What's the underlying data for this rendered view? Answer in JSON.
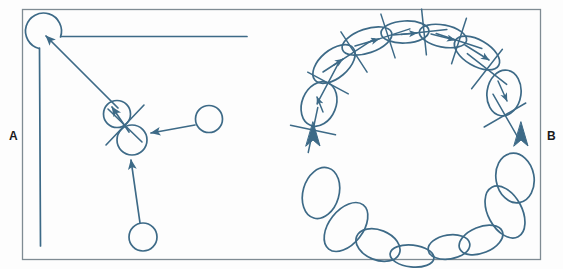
{
  "figure": {
    "background_color": "#fdfdfd",
    "ink_color": "#3d6a87",
    "border_color": "#7f8b93",
    "label_color": "#1a1a1a",
    "width": 563,
    "height": 269,
    "frame": {
      "x": 22,
      "y": 9,
      "width": 519,
      "height": 251
    }
  },
  "labels": {
    "panel_a": "A",
    "panel_b": "B"
  },
  "panel_a": {
    "name": "panel-a-circles-and-arrows",
    "corner_structure": {
      "name": "rounded-corner-track",
      "circle": {
        "cx": 45,
        "cy": 30,
        "r": 18
      },
      "horizontal_line": {
        "x1": 61,
        "y1": 36,
        "x2": 247,
        "y2": 36
      },
      "vertical_line": {
        "x1": 39,
        "y1": 48,
        "x2": 40,
        "y2": 246
      }
    },
    "circles": [
      {
        "name": "circle-corner",
        "cx": 45,
        "cy": 30,
        "r": 18
      },
      {
        "name": "circle-upper-mid",
        "cx": 117,
        "cy": 114,
        "r": 13
      },
      {
        "name": "circle-lower-mid",
        "cx": 132,
        "cy": 139,
        "r": 15
      },
      {
        "name": "circle-right",
        "cx": 209,
        "cy": 119,
        "r": 13
      },
      {
        "name": "circle-bottom",
        "cx": 143,
        "cy": 237,
        "r": 14
      }
    ],
    "cross_mark": {
      "name": "x-crossing-mark",
      "cx": 124,
      "cy": 126,
      "arm": 22
    },
    "arrows": [
      {
        "name": "arrow-to-corner",
        "x1": 118,
        "y1": 110,
        "x2": 42,
        "y2": 35
      },
      {
        "name": "arrow-inner-short",
        "x1": 128,
        "y1": 131,
        "x2": 110,
        "y2": 105
      },
      {
        "name": "arrow-from-right",
        "x1": 196,
        "y1": 125,
        "x2": 148,
        "y2": 133
      },
      {
        "name": "arrow-from-bottom",
        "x1": 140,
        "y1": 224,
        "x2": 131,
        "y2": 158
      }
    ]
  },
  "panel_b": {
    "name": "panel-b-ellipse-ring",
    "ring_center": {
      "cx": 406,
      "cy": 140
    },
    "upper_arc_ellipses": [
      {
        "name": "ellipse-u1",
        "cx": 319,
        "cy": 104,
        "rx": 17,
        "ry": 22,
        "rot": 22,
        "marked": true
      },
      {
        "name": "ellipse-u2",
        "cx": 333,
        "cy": 65,
        "rx": 24,
        "ry": 14,
        "rot": -38,
        "marked": true
      },
      {
        "name": "ellipse-u3",
        "cx": 366,
        "cy": 41,
        "rx": 25,
        "ry": 12,
        "rot": -18,
        "marked": true
      },
      {
        "name": "ellipse-u4",
        "cx": 404,
        "cy": 33,
        "rx": 23,
        "ry": 11,
        "rot": -3,
        "marked": true
      },
      {
        "name": "ellipse-u5",
        "cx": 443,
        "cy": 36,
        "rx": 23,
        "ry": 11,
        "rot": 10,
        "marked": true
      },
      {
        "name": "ellipse-u6",
        "cx": 478,
        "cy": 52,
        "rx": 24,
        "ry": 13,
        "rot": 27,
        "marked": true
      },
      {
        "name": "ellipse-u7",
        "cx": 503,
        "cy": 93,
        "rx": 17,
        "ry": 22,
        "rot": 8,
        "marked": true
      }
    ],
    "lower_arc_ellipses": [
      {
        "name": "ellipse-l1",
        "cx": 321,
        "cy": 193,
        "rx": 18,
        "ry": 25,
        "rot": 18,
        "marked": false
      },
      {
        "name": "ellipse-l2",
        "cx": 345,
        "cy": 227,
        "rx": 17,
        "ry": 27,
        "rot": 36,
        "marked": false
      },
      {
        "name": "ellipse-l3",
        "cx": 377,
        "cy": 245,
        "rx": 22,
        "ry": 14,
        "rot": 22,
        "marked": false
      },
      {
        "name": "ellipse-l4",
        "cx": 411,
        "cy": 255,
        "rx": 21,
        "ry": 11,
        "rot": 7,
        "marked": false
      },
      {
        "name": "ellipse-l5",
        "cx": 448,
        "cy": 246,
        "rx": 21,
        "ry": 12,
        "rot": -8,
        "marked": false
      },
      {
        "name": "ellipse-l6",
        "cx": 481,
        "cy": 241,
        "rx": 22,
        "ry": 13,
        "rot": -20,
        "marked": false
      },
      {
        "name": "ellipse-l7",
        "cx": 505,
        "cy": 213,
        "rx": 17,
        "ry": 27,
        "rot": -28,
        "marked": false
      },
      {
        "name": "ellipse-l8",
        "cx": 514,
        "cy": 179,
        "rx": 19,
        "ry": 24,
        "rot": -10,
        "marked": false
      }
    ],
    "junction_crosses": [
      {
        "name": "cross-j1",
        "cx": 313,
        "cy": 130,
        "arm": 23,
        "a1": 12,
        "a2": 102
      },
      {
        "name": "cross-j2",
        "cx": 328,
        "cy": 83,
        "arm": 23,
        "a1": 28,
        "a2": 118
      },
      {
        "name": "cross-j3",
        "cx": 354,
        "cy": 52,
        "arm": 24,
        "a1": 55,
        "a2": 145
      },
      {
        "name": "cross-j4",
        "cx": 388,
        "cy": 36,
        "arm": 23,
        "a1": 70,
        "a2": 160
      },
      {
        "name": "cross-j5",
        "cx": 424,
        "cy": 32,
        "arm": 23,
        "a1": 82,
        "a2": 172
      },
      {
        "name": "cross-j6",
        "cx": 459,
        "cy": 41,
        "arm": 24,
        "a1": 108,
        "a2": 18
      },
      {
        "name": "cross-j7",
        "cx": 487,
        "cy": 69,
        "arm": 25,
        "a1": 128,
        "a2": 38
      },
      {
        "name": "cross-j8",
        "cx": 505,
        "cy": 115,
        "arm": 24,
        "a1": 150,
        "a2": 60
      }
    ],
    "inner_arrows": [
      {
        "name": "inner-arrow-u1",
        "x1": 323,
        "y1": 111,
        "x2": 316,
        "y2": 96
      },
      {
        "name": "inner-arrow-u2",
        "x1": 324,
        "y1": 71,
        "x2": 342,
        "y2": 60
      },
      {
        "name": "inner-arrow-u3",
        "x1": 356,
        "y1": 45,
        "x2": 378,
        "y2": 39
      },
      {
        "name": "inner-arrow-u4",
        "x1": 394,
        "y1": 35,
        "x2": 416,
        "y2": 33
      },
      {
        "name": "inner-arrow-u5",
        "x1": 432,
        "y1": 34,
        "x2": 454,
        "y2": 40
      },
      {
        "name": "inner-arrow-u6",
        "x1": 466,
        "y1": 45,
        "x2": 488,
        "y2": 59
      },
      {
        "name": "inner-arrow-u7",
        "x1": 498,
        "y1": 82,
        "x2": 506,
        "y2": 100
      }
    ],
    "caret_markers": [
      {
        "name": "caret-marker-left",
        "x": 313,
        "y": 128
      },
      {
        "name": "caret-marker-right",
        "x": 521,
        "y": 128
      }
    ]
  }
}
